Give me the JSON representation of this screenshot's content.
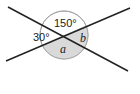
{
  "diagram": {
    "type": "intersecting-lines-angles",
    "angles": {
      "left": "30°",
      "top": "150°",
      "bottom": "a",
      "right": "b"
    },
    "colors": {
      "line": "#222222",
      "unshaded_sector": "#ffffff",
      "shaded_sector": "#d9d9d9",
      "circle_outline": "#999999"
    }
  }
}
